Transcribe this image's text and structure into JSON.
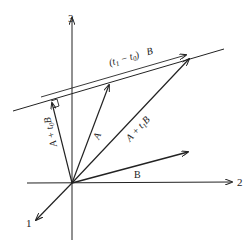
{
  "diagram": {
    "axes": {
      "axis_1_label": "1",
      "axis_2_label": "2",
      "axis_3_label": "3"
    },
    "vectors": {
      "A_label": "A",
      "B_label": "B",
      "A_t0B_label_main": "A + t",
      "A_t0B_label_sub": "0",
      "A_t0B_label_end": "B",
      "A_t1B_label_main": "A + t",
      "A_t1B_label_sub": "1",
      "A_t1B_label_end": "B"
    },
    "line_annotation": {
      "open": "(t",
      "sub1": "1",
      "minus": " − t",
      "sub0": "0",
      "close": ")",
      "B": "B"
    },
    "colors": {
      "ink": "#222222",
      "background": "#ffffff"
    }
  }
}
